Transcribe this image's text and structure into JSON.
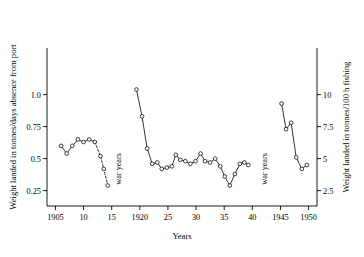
{
  "chart_data": {
    "type": "line",
    "title": "",
    "xlabel": "Years",
    "ylabel": "Weight landed in tonnes/days absence from port",
    "ylabel_right": "Weight landed in tonnes/100 h fishing",
    "xlim": [
      1903.5,
      1951.5
    ],
    "ylim": [
      0.13,
      1.13
    ],
    "ylim_right": [
      1.3,
      11.3
    ],
    "grid": false,
    "legend": null,
    "xticks": [
      1905,
      1910,
      1915,
      1920,
      1925,
      1930,
      1935,
      1940,
      1945,
      1950
    ],
    "xticklabels": [
      "1905",
      "10",
      "15",
      "1920",
      "25",
      "30",
      "35",
      "40",
      "1945",
      "1950"
    ],
    "yticks": [
      0.25,
      0.5,
      0.75,
      1.0
    ],
    "yticklabels": [
      "0.25",
      "0.5",
      "0.75",
      "1.0"
    ],
    "yticks_right": [
      2.5,
      5,
      7.5,
      10
    ],
    "yticklabels_right": [
      "2.5",
      "5",
      "7.5",
      "10"
    ],
    "annotations": [
      {
        "text": "war years",
        "x": 1916.7,
        "y": 0.42,
        "rotation": 90
      },
      {
        "text": "war years",
        "x": 1942.6,
        "y": 0.42,
        "rotation": 90
      }
    ],
    "marker": "open-circle",
    "series": [
      {
        "name": "pre-war-1",
        "style": "solid",
        "x": [
          1906,
          1907,
          1908,
          1909,
          1910,
          1911,
          1912
        ],
        "values": [
          0.6,
          0.54,
          0.6,
          0.65,
          0.63,
          0.65,
          0.63
        ]
      },
      {
        "name": "pre-war-1-decline",
        "style": "dashed",
        "x": [
          1912,
          1913,
          1913.6,
          1914.3
        ],
        "values": [
          0.63,
          0.52,
          0.42,
          0.29
        ]
      },
      {
        "name": "interwar",
        "style": "solid",
        "x": [
          1919.4,
          1920.4,
          1921.3,
          1922.2,
          1923.1,
          1923.9,
          1924.8,
          1925.7,
          1926.4,
          1927.2,
          1928.1,
          1929.0,
          1929.9,
          1930.8,
          1931.6,
          1932.5,
          1933.4,
          1934.3,
          1935.1,
          1936.0,
          1936.9,
          1937.8,
          1938.6,
          1939.3
        ],
        "values": [
          1.04,
          0.83,
          0.58,
          0.46,
          0.47,
          0.42,
          0.43,
          0.44,
          0.53,
          0.49,
          0.48,
          0.46,
          0.48,
          0.54,
          0.48,
          0.47,
          0.5,
          0.44,
          0.36,
          0.29,
          0.38,
          0.46,
          0.47,
          0.45
        ]
      },
      {
        "name": "post-war",
        "style": "solid",
        "x": [
          1945.2,
          1946.0,
          1946.9,
          1947.8,
          1948.8,
          1949.7
        ],
        "values": [
          0.93,
          0.73,
          0.78,
          0.51,
          0.42,
          0.45
        ]
      }
    ]
  }
}
